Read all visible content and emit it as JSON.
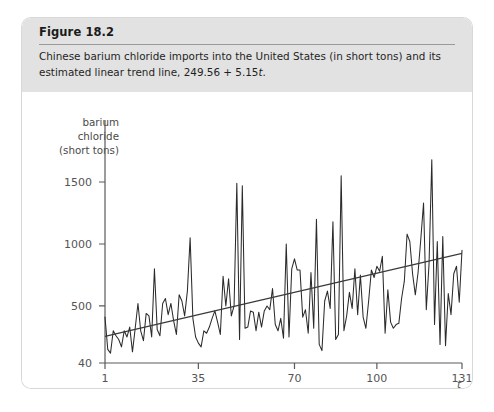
{
  "figure": {
    "title": "Figure 18.2",
    "caption_part1": "Chinese barium chloride imports into the United States (in short tons) and its estimated linear trend line, 249.56 + 5.15",
    "caption_italic": "t",
    "caption_end": "."
  },
  "chart_data": {
    "type": "line",
    "title": "",
    "xlabel": "t",
    "ylabel": "barium chloride (short tons)",
    "ylabel_lines": [
      "barium",
      "chloride",
      "(short tons)"
    ],
    "grid": false,
    "legend": "none",
    "xlim": [
      1,
      131
    ],
    "ylim": [
      40,
      1700
    ],
    "xticks": [
      1,
      35,
      70,
      100,
      131
    ],
    "xtick_labels": [
      "1",
      "35",
      "70",
      "100",
      "131"
    ],
    "yticks": [
      40,
      500,
      1000,
      1500
    ],
    "ytick_labels": [
      "40",
      "500",
      "1000",
      "1500"
    ],
    "series": [
      {
        "name": "Chinese barium chloride imports",
        "type": "line",
        "color": "#2b2b2b",
        "x": [
          1,
          2,
          3,
          4,
          5,
          6,
          7,
          8,
          9,
          10,
          11,
          12,
          13,
          14,
          15,
          16,
          17,
          18,
          19,
          20,
          21,
          22,
          23,
          24,
          25,
          26,
          27,
          28,
          29,
          30,
          31,
          32,
          33,
          34,
          35,
          36,
          37,
          38,
          39,
          40,
          41,
          42,
          43,
          44,
          45,
          46,
          47,
          48,
          49,
          50,
          51,
          52,
          53,
          54,
          55,
          56,
          57,
          58,
          59,
          60,
          61,
          62,
          63,
          64,
          65,
          66,
          67,
          68,
          69,
          70,
          71,
          72,
          73,
          74,
          75,
          76,
          77,
          78,
          79,
          80,
          81,
          82,
          83,
          84,
          85,
          86,
          87,
          88,
          89,
          90,
          91,
          92,
          93,
          94,
          95,
          96,
          97,
          98,
          99,
          100,
          101,
          102,
          103,
          104,
          105,
          106,
          107,
          108,
          109,
          110,
          111,
          112,
          113,
          114,
          115,
          116,
          117,
          118,
          119,
          120,
          121,
          122,
          123,
          124,
          125,
          126,
          127,
          128,
          129,
          130,
          131
        ],
        "values": [
          410,
          150,
          120,
          300,
          260,
          230,
          170,
          300,
          250,
          330,
          130,
          320,
          520,
          300,
          220,
          440,
          420,
          250,
          800,
          310,
          260,
          520,
          560,
          430,
          520,
          380,
          270,
          590,
          540,
          420,
          620,
          1050,
          400,
          250,
          200,
          170,
          300,
          280,
          330,
          400,
          460,
          370,
          270,
          740,
          500,
          720,
          420,
          500,
          1490,
          230,
          1470,
          320,
          330,
          460,
          450,
          300,
          450,
          330,
          460,
          500,
          470,
          640,
          350,
          300,
          400,
          240,
          1000,
          250,
          800,
          880,
          790,
          790,
          410,
          470,
          280,
          770,
          320,
          1200,
          190,
          140,
          540,
          620,
          480,
          1180,
          230,
          270,
          1550,
          300,
          420,
          610,
          480,
          800,
          430,
          750,
          410,
          320,
          540,
          790,
          730,
          820,
          780,
          900,
          280,
          630,
          370,
          320,
          350,
          360,
          560,
          700,
          1080,
          1020,
          760,
          590,
          770,
          1040,
          1330,
          470,
          840,
          1680,
          350,
          1020,
          190,
          1060,
          180,
          600,
          430,
          760,
          820,
          530,
          950
        ]
      },
      {
        "name": "Estimated linear trend line",
        "type": "line",
        "color": "#3a3a3a",
        "equation": "249.56 + 5.15t",
        "intercept": 249.56,
        "slope": 5.15,
        "x": [
          1,
          131
        ],
        "values": [
          254.71,
          924.21
        ]
      }
    ]
  }
}
